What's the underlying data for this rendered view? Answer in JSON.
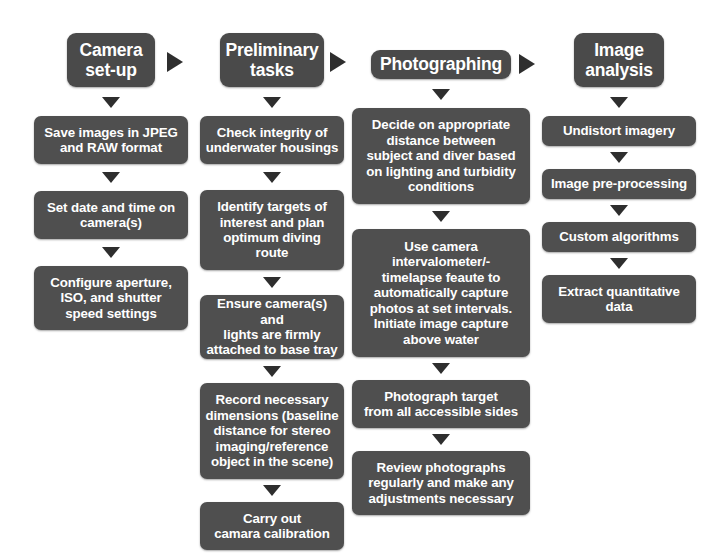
{
  "diagram": {
    "background_color": "#ffffff",
    "node_color": "#4c4c4c",
    "node_text_color": "#ffffff",
    "arrow_color": "#2e2e2e"
  },
  "columns": [
    {
      "id": "camera-set-up",
      "header": "Camera\nset-up",
      "steps": [
        "Save images in JPEG\nand RAW format",
        "Set date and time on\ncamera(s)",
        "Configure aperture,\nISO, and shutter\nspeed settings"
      ]
    },
    {
      "id": "preliminary-tasks",
      "header": "Preliminary\ntasks",
      "steps": [
        "Check integrity of\nunderwater housings",
        "Identify targets of\ninterest and plan\noptimum diving\nroute",
        "Ensure camera(s) and\nlights are firmly\nattached to base tray",
        "Record necessary\ndimensions (baseline\ndistance for stereo\nimaging/reference\nobject in the scene)",
        "Carry out\ncamara calibration"
      ]
    },
    {
      "id": "photographing",
      "header": "Photographing",
      "steps": [
        "Decide on appropriate\ndistance between\nsubject and diver based\non lighting and turbidity\nconditions",
        "Use camera\nintervalometer/-\ntimelapse feaute to\nautomatically capture\nphotos at set intervals.\nInitiate image capture\nabove water",
        "Photograph target\nfrom all accessible sides",
        "Review photographs\nregularly and make any\nadjustments necessary"
      ]
    },
    {
      "id": "image-analysis",
      "header": "Image\nanalysis",
      "steps": [
        "Undistort imagery",
        "Image pre-processing",
        "Custom algorithms",
        "Extract quantitative\ndata"
      ]
    }
  ]
}
